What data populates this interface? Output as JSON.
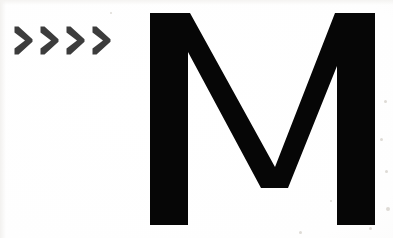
{
  "image": {
    "kind": "scanned-print-graphic",
    "background_color": "#fdfdfc",
    "width": 393,
    "height": 238
  },
  "chevrons": {
    "group_label": "double-angle arrows pointing right",
    "count": 4,
    "color": "#3c3c3c",
    "items": [
      {
        "name": "chevron-1",
        "alt": ">"
      },
      {
        "name": "chevron-2",
        "alt": ">"
      },
      {
        "name": "chevron-3",
        "alt": ">"
      },
      {
        "name": "chevron-4",
        "alt": ">"
      }
    ],
    "text_equivalent": ">>>>"
  },
  "letterform": {
    "character": "M",
    "label": "capital letter M",
    "color": "#060606",
    "style": "bold sans-serif display",
    "alt_text": "M"
  },
  "artifacts": {
    "label": "scan speckles",
    "color": "#dedbd6",
    "specks": [
      {
        "x": 385,
        "y": 101,
        "r": 2
      },
      {
        "x": 381,
        "y": 139,
        "r": 2
      },
      {
        "x": 386,
        "y": 171,
        "r": 2
      },
      {
        "x": 388,
        "y": 209,
        "r": 3
      },
      {
        "x": 370,
        "y": 228,
        "r": 2
      },
      {
        "x": 300,
        "y": 232,
        "r": 2
      },
      {
        "x": 330,
        "y": 200,
        "r": 1
      },
      {
        "x": 110,
        "y": 12,
        "r": 1
      }
    ]
  }
}
